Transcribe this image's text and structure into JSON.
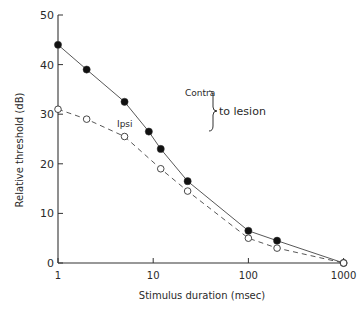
{
  "chart_data": {
    "type": "line",
    "title": "",
    "xlabel": "Stimulus duration (msec)",
    "ylabel": "Relative threshold (dB)",
    "xscale": "log",
    "xlim": [
      1,
      1000
    ],
    "ylim": [
      0,
      50
    ],
    "x_ticks": [
      1,
      10,
      100,
      1000
    ],
    "x_tick_labels": [
      "1",
      "10",
      "100",
      "1000"
    ],
    "y_ticks": [
      0,
      10,
      20,
      30,
      40,
      50
    ],
    "y_tick_labels": [
      "0",
      "10",
      "20",
      "30",
      "40",
      "50"
    ],
    "grid": false,
    "series": [
      {
        "name": "Contra",
        "marker": "filled-circle",
        "line": "solid",
        "x": [
          1,
          2,
          5,
          9,
          12,
          23,
          100,
          200,
          1000
        ],
        "y": [
          44,
          39,
          32.5,
          26.5,
          23,
          16.5,
          6.5,
          4.5,
          0
        ]
      },
      {
        "name": "Ipsi",
        "marker": "open-circle",
        "line": "dashed",
        "x": [
          1,
          2,
          5,
          12,
          23,
          100,
          200,
          1000
        ],
        "y": [
          31,
          29,
          25.5,
          19,
          14.5,
          5,
          3,
          0
        ]
      }
    ],
    "annotations": [
      {
        "text": "Contra",
        "x_px": 185,
        "y_px": 96
      },
      {
        "text": "Ipsi",
        "x_px": 117,
        "y_px": 127
      },
      {
        "text": "to lesion",
        "x_px": 219,
        "y_px": 115
      }
    ]
  }
}
